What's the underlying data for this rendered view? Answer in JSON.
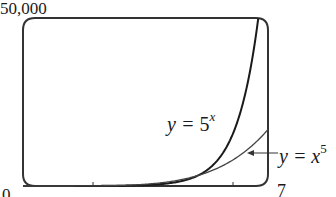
{
  "chart_data": {
    "type": "line",
    "title": "",
    "xlabel": "",
    "ylabel": "",
    "xlim": [
      0,
      7
    ],
    "ylim": [
      0,
      50000
    ],
    "grid": false,
    "legend": "inline annotations",
    "tick_labels": {
      "x_min": "0",
      "x_max": "7",
      "y_max": "50,000"
    },
    "x_ticks": [
      2,
      4,
      6
    ],
    "series": [
      {
        "name": "y = 5^x",
        "label_base": "y = 5",
        "label_exp": "x",
        "x": [
          0,
          1,
          2,
          3,
          4,
          5,
          5.5,
          6,
          6.3,
          6.5,
          6.72
        ],
        "values": [
          1,
          5,
          25,
          125,
          625,
          3125,
          6988,
          15625,
          25373,
          34939,
          50000
        ],
        "color": "#1a1a1a",
        "stroke_width": 2
      },
      {
        "name": "y = x^5",
        "label_base": "y = x",
        "label_exp": "5",
        "x": [
          0,
          1,
          2,
          3,
          4,
          5,
          6,
          7
        ],
        "values": [
          0,
          1,
          32,
          243,
          1024,
          3125,
          7776,
          16807
        ],
        "color": "#444444",
        "stroke_width": 1.3
      }
    ],
    "annotations": [
      {
        "text": "y = 5^x",
        "points_to": "y = 5^x curve"
      },
      {
        "text": "y = x^5",
        "arrow": true,
        "points_to": "y = x^5 curve near x = 6"
      }
    ]
  },
  "labels": {
    "y_max": "50,000",
    "x_min": "0",
    "x_max": "7",
    "eq1_base": "y = ",
    "eq1_num": "5",
    "eq1_exp": "x",
    "eq2_base": "y = x",
    "eq2_exp": "5"
  }
}
